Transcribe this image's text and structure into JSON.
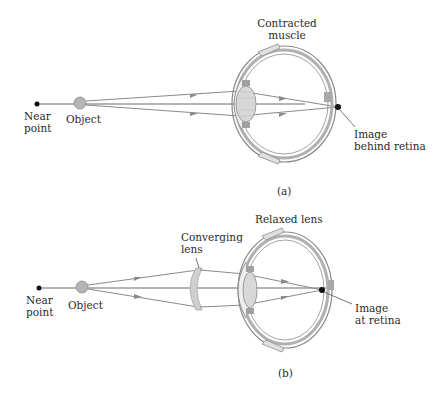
{
  "panel_a": {
    "near_point": "Near\npoint",
    "object": "Object",
    "top_label": "Contracted\nmuscle",
    "image_label": "Image\nbehind retina",
    "caption": "(a)"
  },
  "panel_b": {
    "near_point": "Near\npoint",
    "object": "Object",
    "lens_label": "Converging\nlens",
    "top_label": "Relaxed lens",
    "image_label": "Image\nat retina",
    "caption": "(b)"
  },
  "colors": {
    "ray": "#8a8a8a",
    "eye_outline": "#7a7a7a",
    "eye_fill": "#e6e6e6",
    "object_fill": "#b5b5b5",
    "dot": "#111111",
    "lens_fill": "#d0d0d0"
  }
}
